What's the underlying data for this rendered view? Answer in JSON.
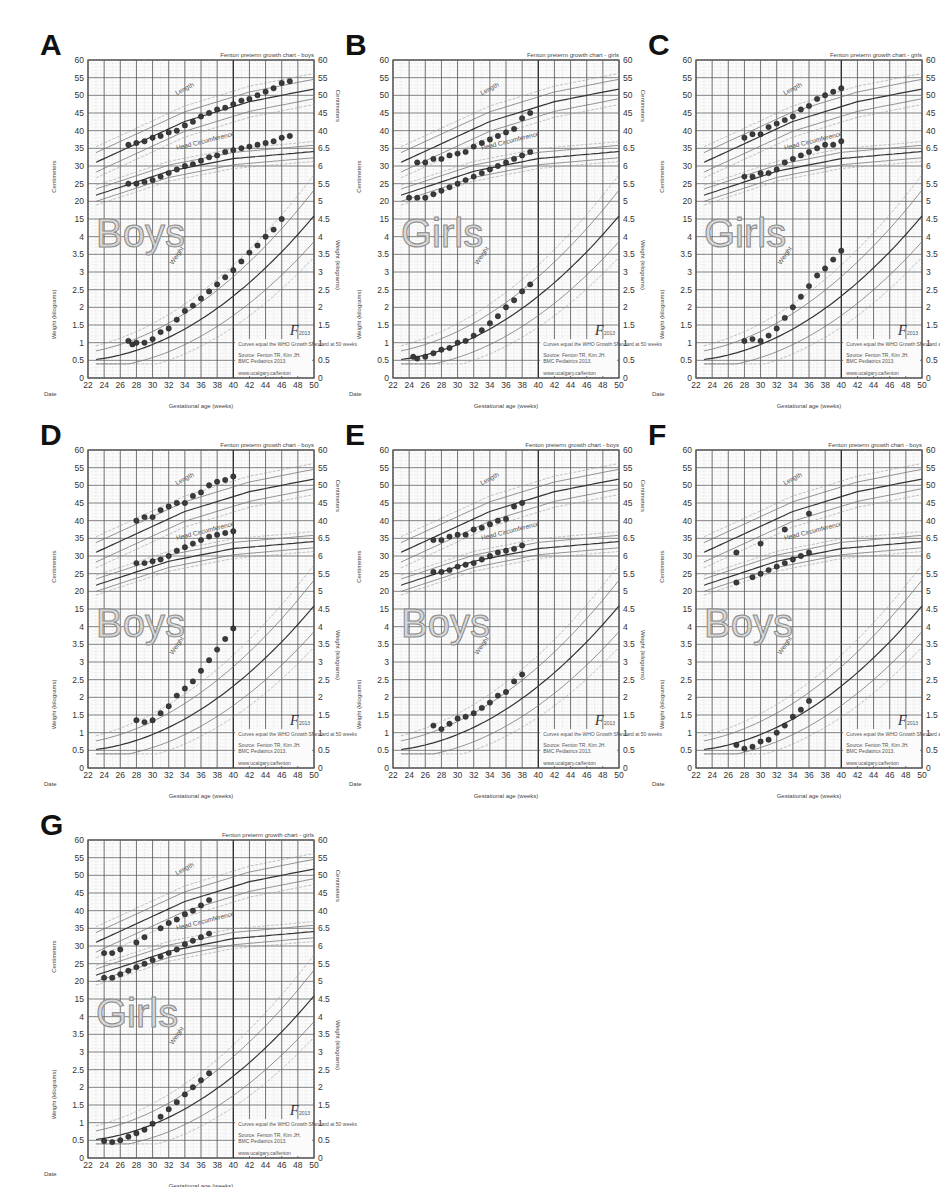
{
  "figure": {
    "common": {
      "chart_title_boys": "Fenton preterm growth chart - boys",
      "chart_title_girls": "Fenton preterm growth chart - girls",
      "xlabel": "Gestational age (weeks)",
      "date_label": "Date",
      "ylabel_cm": "Centimeters",
      "ylabel_kg": "Weight (kilograms)",
      "curve_label_length": "Length",
      "curve_label_head": "Head Circumference",
      "curve_label_weight": "Weight",
      "logo": "F2013",
      "legend_note": "Curves equal the WHO Growth Standard at 50 weeks",
      "legend_source": "Source: Fenton TR, Kim JH. A systematic review and meta-analysis to revise the Fenton growth chart for preterm infants. BMC Pediatrics 2013.",
      "legend_url": "www.ucalgary.ca/fenton",
      "x_ticks": [
        22,
        24,
        26,
        28,
        30,
        32,
        34,
        36,
        38,
        40,
        42,
        44,
        46,
        48,
        50
      ],
      "y_left_cm_ticks": [
        60,
        55,
        50,
        45,
        40,
        35,
        30,
        25,
        20,
        15
      ],
      "y_left_kg_ticks": [
        4,
        3.5,
        3,
        2.5,
        2,
        1.5,
        1,
        0.5,
        0
      ],
      "y_right_cm_ticks": [
        60,
        55,
        50,
        45,
        40
      ],
      "y_right_kg_ticks": [
        6.5,
        6,
        5.5,
        5,
        4.5,
        4,
        3.5,
        3,
        2.5,
        2,
        1.5,
        1,
        0.5,
        0
      ]
    }
  },
  "chart_data": [
    {
      "panel": "A",
      "type": "scatter",
      "sex_label": "Boys",
      "sex": "boys",
      "title": "Fenton preterm growth chart - boys",
      "xlabel": "Gestational age (weeks)",
      "xlim": [
        22,
        50
      ],
      "ylabel_top": "Centimeters",
      "ylabel_bottom": "Weight (kilograms)",
      "series": [
        {
          "name": "Length (cm)",
          "x": [
            27,
            28,
            29,
            30,
            31,
            32,
            33,
            34,
            35,
            36,
            37,
            38,
            39,
            40,
            41,
            42,
            43,
            44,
            45,
            46,
            47
          ],
          "values": [
            36,
            36.5,
            37,
            38,
            38.5,
            39.5,
            40,
            41.5,
            42.5,
            44,
            45,
            46,
            46.5,
            47.5,
            48.5,
            49,
            50,
            51,
            52,
            53.5,
            54
          ]
        },
        {
          "name": "Head Circumference (cm)",
          "x": [
            27,
            28,
            29,
            30,
            31,
            32,
            33,
            34,
            35,
            36,
            37,
            38,
            39,
            40,
            41,
            42,
            43,
            44,
            45,
            46,
            47
          ],
          "values": [
            25,
            25,
            25.5,
            26,
            27,
            28,
            29,
            30,
            30.5,
            31.5,
            32.5,
            33,
            34,
            34.5,
            35,
            35.5,
            36,
            36.5,
            37,
            38,
            38.5
          ]
        },
        {
          "name": "Weight (kg)",
          "x": [
            27,
            27.5,
            28,
            29,
            30,
            31,
            32,
            33,
            34,
            35,
            36,
            37,
            38,
            39,
            40,
            41,
            42,
            43,
            44,
            45,
            46,
            47
          ],
          "values": [
            1.05,
            0.95,
            1.0,
            1.0,
            1.1,
            1.3,
            1.4,
            1.65,
            1.9,
            2.05,
            2.25,
            2.45,
            2.65,
            2.85,
            3.05,
            3.3,
            3.55,
            3.75,
            4.0,
            4.2,
            4.5
          ]
        }
      ]
    },
    {
      "panel": "B",
      "type": "scatter",
      "sex_label": "Girls",
      "sex": "girls",
      "title": "Fenton preterm growth chart - girls",
      "xlabel": "Gestational age (weeks)",
      "xlim": [
        22,
        50
      ],
      "ylabel_top": "Centimeters",
      "ylabel_bottom": "Weight (kilograms)",
      "series": [
        {
          "name": "Length (cm)",
          "x": [
            25,
            26,
            27,
            28,
            29,
            30,
            31,
            32,
            33,
            34,
            35,
            36,
            37,
            38,
            39
          ],
          "values": [
            31,
            31,
            32,
            32,
            33,
            33.5,
            34,
            35.5,
            36.5,
            37.5,
            38.5,
            39.5,
            40.5,
            43.5,
            45
          ]
        },
        {
          "name": "Head Circumference (cm)",
          "x": [
            24,
            25,
            26,
            27,
            28,
            29,
            30,
            31,
            32,
            33,
            34,
            35,
            36,
            37,
            38,
            39
          ],
          "values": [
            21,
            21,
            21,
            22,
            23,
            24,
            25,
            26,
            27,
            28,
            29,
            30,
            31,
            32,
            33,
            34
          ]
        },
        {
          "name": "Weight (kg)",
          "x": [
            24.5,
            25,
            26,
            27,
            28,
            29,
            30,
            31,
            32,
            33,
            34,
            35,
            36,
            37,
            38,
            39
          ],
          "values": [
            0.6,
            0.55,
            0.6,
            0.7,
            0.8,
            0.85,
            1.0,
            1.05,
            1.2,
            1.35,
            1.55,
            1.75,
            2.0,
            2.2,
            2.45,
            2.65
          ]
        }
      ]
    },
    {
      "panel": "C",
      "type": "scatter",
      "sex_label": "Girls",
      "sex": "girls",
      "title": "Fenton preterm growth chart - girls",
      "xlabel": "Gestational age (weeks)",
      "xlim": [
        22,
        50
      ],
      "ylabel_top": "Centimeters",
      "ylabel_bottom": "Weight (kilograms)",
      "series": [
        {
          "name": "Length (cm)",
          "x": [
            28,
            29,
            30,
            31,
            32,
            33,
            34,
            35,
            36,
            37,
            38,
            39,
            40
          ],
          "values": [
            38,
            39,
            39,
            41,
            42,
            43,
            44,
            46,
            47,
            49,
            50,
            51,
            52
          ]
        },
        {
          "name": "Head Circumference (cm)",
          "x": [
            28,
            29,
            30,
            31,
            32,
            33,
            34,
            35,
            36,
            37,
            38,
            39,
            40
          ],
          "values": [
            27,
            27,
            28,
            28,
            29,
            31,
            32,
            33,
            34,
            35,
            36,
            36,
            37
          ]
        },
        {
          "name": "Weight (kg)",
          "x": [
            28,
            29,
            30,
            31,
            32,
            33,
            34,
            35,
            36,
            37,
            38,
            39,
            40
          ],
          "values": [
            1.05,
            1.1,
            1.05,
            1.2,
            1.4,
            1.7,
            2.0,
            2.3,
            2.6,
            2.9,
            3.1,
            3.35,
            3.6
          ]
        }
      ]
    },
    {
      "panel": "D",
      "type": "scatter",
      "sex_label": "Boys",
      "sex": "boys",
      "title": "Fenton preterm growth chart - boys",
      "xlabel": "Gestational age (weeks)",
      "xlim": [
        22,
        50
      ],
      "ylabel_top": "Centimeters",
      "ylabel_bottom": "Weight (kilograms)",
      "series": [
        {
          "name": "Length (cm)",
          "x": [
            28,
            29,
            30,
            31,
            32,
            33,
            34,
            35,
            36,
            37,
            38,
            39,
            40
          ],
          "values": [
            40,
            41,
            41,
            43,
            44,
            45,
            45,
            47,
            48,
            50,
            51,
            51.5,
            52.5
          ]
        },
        {
          "name": "Head Circumference (cm)",
          "x": [
            28,
            29,
            30,
            31,
            32,
            33,
            34,
            35,
            36,
            37,
            38,
            39,
            40
          ],
          "values": [
            28,
            28,
            28.5,
            29,
            30,
            31.5,
            32.5,
            33.5,
            34.5,
            35.5,
            36,
            36.5,
            37
          ]
        },
        {
          "name": "Weight (kg)",
          "x": [
            28,
            29,
            30,
            31,
            32,
            33,
            34,
            35,
            36,
            37,
            38,
            39,
            40
          ],
          "values": [
            1.35,
            1.3,
            1.35,
            1.55,
            1.75,
            2.05,
            2.25,
            2.45,
            2.75,
            3.05,
            3.35,
            3.65,
            3.95
          ]
        }
      ]
    },
    {
      "panel": "E",
      "type": "scatter",
      "sex_label": "Boys",
      "sex": "boys",
      "title": "Fenton preterm growth chart - boys",
      "xlabel": "Gestational age (weeks)",
      "xlim": [
        22,
        50
      ],
      "ylabel_top": "Centimeters",
      "ylabel_bottom": "Weight (kilograms)",
      "series": [
        {
          "name": "Length (cm)",
          "x": [
            27,
            28,
            29,
            30,
            31,
            32,
            33,
            34,
            35,
            36,
            37,
            38
          ],
          "values": [
            34.5,
            34.5,
            35.5,
            36,
            36,
            37.5,
            38,
            39,
            40,
            40.5,
            44,
            45
          ]
        },
        {
          "name": "Head Circumference (cm)",
          "x": [
            27,
            28,
            29,
            30,
            31,
            32,
            33,
            34,
            35,
            36,
            37,
            38
          ],
          "values": [
            25.5,
            25.5,
            26,
            27,
            27.5,
            28,
            29,
            30,
            31,
            31.5,
            32,
            33
          ]
        },
        {
          "name": "Weight (kg)",
          "x": [
            27,
            28,
            29,
            30,
            31,
            32,
            33,
            34,
            35,
            36,
            37,
            38
          ],
          "values": [
            1.2,
            1.1,
            1.25,
            1.4,
            1.45,
            1.55,
            1.7,
            1.85,
            2.05,
            2.15,
            2.45,
            2.65
          ]
        }
      ]
    },
    {
      "panel": "F",
      "type": "scatter",
      "sex_label": "Boys",
      "sex": "boys",
      "title": "Fenton preterm growth chart - boys",
      "xlabel": "Gestational age (weeks)",
      "xlim": [
        22,
        50
      ],
      "ylabel_top": "Centimeters",
      "ylabel_bottom": "Weight (kilograms)",
      "series": [
        {
          "name": "Length (cm)",
          "x": [
            27,
            30,
            33,
            36
          ],
          "values": [
            31,
            33.5,
            37.5,
            42
          ]
        },
        {
          "name": "Head Circumference (cm)",
          "x": [
            27,
            29,
            30,
            31,
            32,
            33,
            34,
            35,
            36
          ],
          "values": [
            22.5,
            24,
            25,
            26,
            27,
            28,
            29,
            30,
            31
          ]
        },
        {
          "name": "Weight (kg)",
          "x": [
            27,
            28,
            29,
            30,
            31,
            32,
            33,
            34,
            35,
            36
          ],
          "values": [
            0.65,
            0.55,
            0.6,
            0.75,
            0.8,
            1.0,
            1.2,
            1.45,
            1.65,
            1.9
          ]
        }
      ]
    },
    {
      "panel": "G",
      "type": "scatter",
      "sex_label": "Girls",
      "sex": "girls",
      "title": "Fenton preterm growth chart - girls",
      "xlabel": "Gestational age (weeks)",
      "xlim": [
        22,
        50
      ],
      "ylabel_top": "Centimeters",
      "ylabel_bottom": "Weight (kilograms)",
      "series": [
        {
          "name": "Length (cm)",
          "x": [
            24,
            25,
            26,
            28,
            29,
            31,
            32,
            33,
            34,
            35,
            36,
            37
          ],
          "values": [
            28,
            28,
            29,
            31,
            32.5,
            35,
            36.5,
            37.5,
            39,
            40,
            41.5,
            43
          ]
        },
        {
          "name": "Head Circumference (cm)",
          "x": [
            24,
            25,
            26,
            27,
            28,
            29,
            30,
            31,
            32,
            33,
            34,
            35,
            36,
            37
          ],
          "values": [
            21,
            21,
            22,
            23,
            24,
            25,
            26,
            27,
            28,
            29,
            30.5,
            31.5,
            32.5,
            33.5
          ]
        },
        {
          "name": "Weight (kg)",
          "x": [
            24,
            25,
            26,
            27,
            28,
            29,
            30,
            31,
            32,
            33,
            34,
            35,
            36,
            37
          ],
          "values": [
            0.48,
            0.45,
            0.5,
            0.6,
            0.7,
            0.8,
            0.97,
            1.17,
            1.38,
            1.58,
            1.8,
            2.0,
            2.2,
            2.4
          ]
        }
      ]
    }
  ],
  "layout": {
    "panels": [
      {
        "letter": "A",
        "x": 40,
        "y": 20
      },
      {
        "letter": "B",
        "x": 345,
        "y": 20
      },
      {
        "letter": "C",
        "x": 648,
        "y": 20
      },
      {
        "letter": "D",
        "x": 40,
        "y": 410
      },
      {
        "letter": "E",
        "x": 345,
        "y": 410
      },
      {
        "letter": "F",
        "x": 648,
        "y": 410
      },
      {
        "letter": "G",
        "x": 40,
        "y": 800
      }
    ]
  }
}
